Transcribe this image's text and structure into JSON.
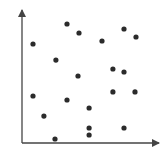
{
  "chart_data": {
    "type": "scatter",
    "title": "",
    "xlabel": "",
    "ylabel": "",
    "xlim": [
      0,
      100
    ],
    "ylim": [
      0,
      100
    ],
    "grid": false,
    "legend": null,
    "axes_style": "arrows",
    "point_color": "#2b2b2b",
    "axis_color": "#444444",
    "series": [
      {
        "name": "points",
        "points": [
          {
            "x": 32.6,
            "y": 88.8
          },
          {
            "x": 41.3,
            "y": 82.1
          },
          {
            "x": 73.9,
            "y": 85.1
          },
          {
            "x": 82.6,
            "y": 79.1
          },
          {
            "x": 58.0,
            "y": 76.1
          },
          {
            "x": 8.0,
            "y": 73.9
          },
          {
            "x": 24.6,
            "y": 61.9
          },
          {
            "x": 65.9,
            "y": 55.2
          },
          {
            "x": 73.9,
            "y": 53.0
          },
          {
            "x": 40.6,
            "y": 50.0
          },
          {
            "x": 8.0,
            "y": 35.1
          },
          {
            "x": 65.9,
            "y": 38.1
          },
          {
            "x": 81.9,
            "y": 38.1
          },
          {
            "x": 32.6,
            "y": 32.1
          },
          {
            "x": 48.6,
            "y": 26.1
          },
          {
            "x": 15.9,
            "y": 20.1
          },
          {
            "x": 48.6,
            "y": 11.2
          },
          {
            "x": 73.9,
            "y": 11.2
          },
          {
            "x": 48.6,
            "y": 6.0
          },
          {
            "x": 23.9,
            "y": 3.0
          }
        ]
      }
    ]
  }
}
